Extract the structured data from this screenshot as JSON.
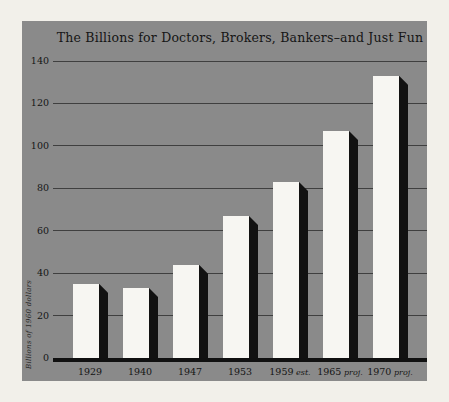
{
  "chart_data": {
    "type": "bar",
    "title": "The Billions for Doctors, Brokers, Bankers–and Just Fun",
    "ylabel": "Billions of 1960 dollars",
    "xlabel": "",
    "categories": [
      {
        "year": "1929",
        "suffix": ""
      },
      {
        "year": "1940",
        "suffix": ""
      },
      {
        "year": "1947",
        "suffix": ""
      },
      {
        "year": "1953",
        "suffix": ""
      },
      {
        "year": "1959",
        "suffix": "est."
      },
      {
        "year": "1965",
        "suffix": "proj."
      },
      {
        "year": "1970",
        "suffix": "proj."
      }
    ],
    "values": [
      35,
      33,
      44,
      67,
      83,
      107,
      133
    ],
    "ylim": [
      0,
      140
    ],
    "yticks": [
      0,
      20,
      40,
      60,
      80,
      100,
      120,
      140
    ],
    "grid": true,
    "legend": "none",
    "bar_style": "white bars with black 3D drop-shadow on right side"
  },
  "colors": {
    "page_bg": "#f2f0ea",
    "panel_bg": "#8a8a8a",
    "bar_face": "#f7f6f2",
    "bar_shadow": "#121212",
    "gridline": "#3f3f3f",
    "baseline": "#111111",
    "text": "#151515"
  }
}
